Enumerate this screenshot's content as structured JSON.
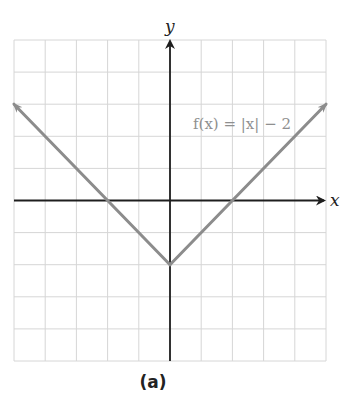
{
  "chart_data": {
    "type": "line",
    "title": "",
    "function_label": "f(x) = |x| − 2",
    "xlabel": "x",
    "ylabel": "y",
    "xlim": [
      -5,
      5
    ],
    "ylim": [
      -5,
      5
    ],
    "grid": true,
    "grid_step": 1,
    "tick_labels": false,
    "series": [
      {
        "name": "f(x) = |x| − 2",
        "x": [
          -5,
          -2,
          0,
          2,
          5
        ],
        "y": [
          3,
          0,
          -2,
          0,
          3
        ],
        "arrows_at_ends": true
      }
    ],
    "key_points": {
      "vertex": [
        0,
        -2
      ],
      "x_intercepts": [
        [
          -2,
          0
        ],
        [
          2,
          0
        ]
      ],
      "y_intercept": [
        0,
        -2
      ]
    },
    "caption": "(a)"
  },
  "labels": {
    "x_axis": "x",
    "y_axis": "y",
    "function": "f(x) = |x| − 2",
    "caption": "(a)"
  },
  "colors": {
    "grid": "#d6d6d6",
    "axes": "#1e1e1e",
    "curve": "#8c8c8c",
    "function_label": "#8f8f8f"
  }
}
